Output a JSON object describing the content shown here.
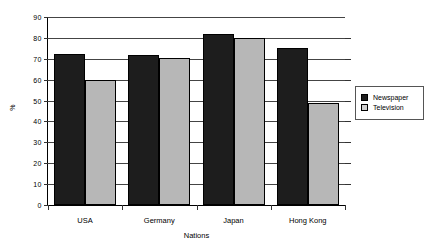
{
  "chart_data": {
    "type": "bar",
    "title": "",
    "xlabel": "Nations",
    "ylabel": "%",
    "categories": [
      "USA",
      "Germany",
      "Japan",
      "Hong Kong"
    ],
    "series": [
      {
        "name": "Newspaper",
        "color": "#1d1d1d",
        "values": [
          72.5,
          72,
          82,
          75
        ]
      },
      {
        "name": "Television",
        "color": "#b7b7b7",
        "values": [
          60,
          70.5,
          80,
          49
        ]
      }
    ],
    "ylim": [
      0,
      90
    ],
    "yticks": [
      0,
      10,
      20,
      30,
      40,
      50,
      60,
      70,
      80,
      90
    ],
    "ytick_labels": [
      "0",
      "10",
      "20",
      "30",
      "40",
      "50",
      "60",
      "70",
      "80",
      "90"
    ],
    "grid": true,
    "legend_position": "right",
    "legend_entries": [
      "Newspaper",
      "Television"
    ]
  }
}
